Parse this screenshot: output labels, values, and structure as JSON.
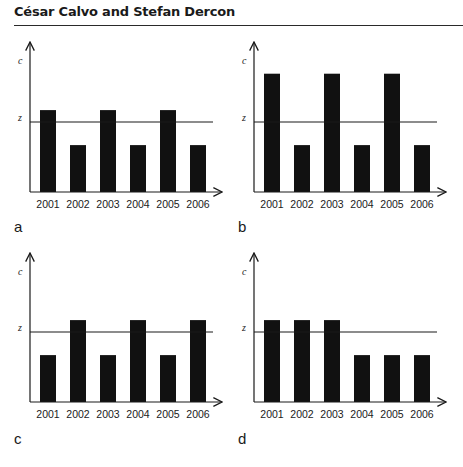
{
  "header": {
    "authors": "César Calvo and Stefan Dercon"
  },
  "caption_partial": "Figure",
  "chart_data": [
    {
      "type": "bar",
      "panel": "a",
      "categories": [
        "2001",
        "2002",
        "2003",
        "2004",
        "2005",
        "2006"
      ],
      "values": [
        1.17,
        0.67,
        1.17,
        0.67,
        1.17,
        0.67
      ],
      "reference_line": {
        "label": "z",
        "value": 1.0
      },
      "xlabel": "",
      "ylabel": "c",
      "ylim": [
        0,
        2.1
      ],
      "grid": false,
      "units": "relative to poverty line z (no numeric ticks shown)"
    },
    {
      "type": "bar",
      "panel": "b",
      "categories": [
        "2001",
        "2002",
        "2003",
        "2004",
        "2005",
        "2006"
      ],
      "values": [
        1.69,
        0.67,
        1.69,
        0.67,
        1.69,
        0.67
      ],
      "reference_line": {
        "label": "z",
        "value": 1.0
      },
      "xlabel": "",
      "ylabel": "c",
      "ylim": [
        0,
        2.1
      ],
      "grid": false
    },
    {
      "type": "bar",
      "panel": "c",
      "categories": [
        "2001",
        "2002",
        "2003",
        "2004",
        "2005",
        "2006"
      ],
      "values": [
        0.67,
        1.17,
        0.67,
        1.17,
        0.67,
        1.17
      ],
      "reference_line": {
        "label": "z",
        "value": 1.0
      },
      "xlabel": "",
      "ylabel": "c",
      "ylim": [
        0,
        2.1
      ],
      "grid": false
    },
    {
      "type": "bar",
      "panel": "d",
      "categories": [
        "2001",
        "2002",
        "2003",
        "2004",
        "2005",
        "2006"
      ],
      "values": [
        1.17,
        1.17,
        1.17,
        0.67,
        0.67,
        0.67
      ],
      "reference_line": {
        "label": "z",
        "value": 1.0
      },
      "xlabel": "",
      "ylabel": "c",
      "ylim": [
        0,
        2.1
      ],
      "grid": false
    }
  ]
}
